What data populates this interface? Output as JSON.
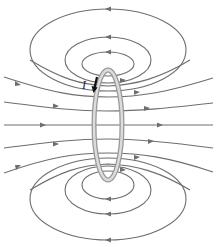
{
  "figure": {
    "current_label": "I",
    "colors": {
      "field_line": "#6e6e6e",
      "loop_outer": "#9a9a9a",
      "loop_inner": "#dcdcdc",
      "current_arrow": "#111111",
      "background": "#ffffff"
    },
    "elements": {
      "loop": "current-carrying loop (seen edge-on)",
      "current_direction": "downward on the front side of the loop",
      "field_through_loop": "left to right",
      "closed_loops_top": 3,
      "closed_loops_bottom": 3,
      "open_field_lines": 5,
      "closed_loop_direction": "right to left at outer extreme (counter-circulating return)"
    }
  }
}
